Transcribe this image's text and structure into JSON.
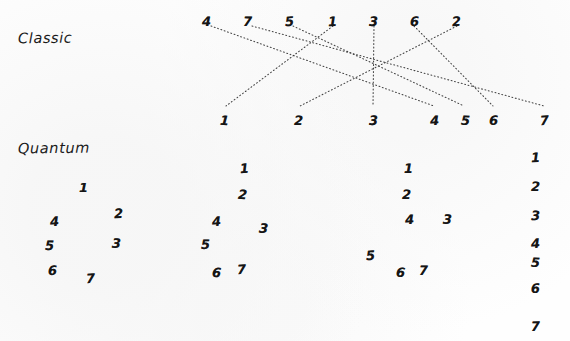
{
  "figure": {
    "background_color": "#fefefe",
    "ink_color": "#151515",
    "line_color": "#3a3a3a",
    "width": 570,
    "height": 341
  },
  "labels": {
    "classic": "Classic",
    "quantum": "Quantum"
  },
  "classic": {
    "input_label": "unsorted permutation",
    "output_label": "sorted sequence",
    "input": [
      {
        "value": "4",
        "x": 202,
        "y": 14
      },
      {
        "value": "7",
        "x": 243,
        "y": 14
      },
      {
        "value": "5",
        "x": 285,
        "y": 14
      },
      {
        "value": "1",
        "x": 328,
        "y": 14
      },
      {
        "value": "3",
        "x": 369,
        "y": 14
      },
      {
        "value": "6",
        "x": 410,
        "y": 14
      },
      {
        "value": "2",
        "x": 452,
        "y": 14
      }
    ],
    "output": [
      {
        "value": "1",
        "x": 220,
        "y": 113
      },
      {
        "value": "2",
        "x": 294,
        "y": 113
      },
      {
        "value": "3",
        "x": 369,
        "y": 113
      },
      {
        "value": "4",
        "x": 430,
        "y": 113
      },
      {
        "value": "5",
        "x": 461,
        "y": 113
      },
      {
        "value": "6",
        "x": 489,
        "y": 113
      },
      {
        "value": "7",
        "x": 540,
        "y": 113
      }
    ],
    "mapping": [
      {
        "from": "4",
        "to": "4",
        "x1": 211,
        "y1": 26,
        "x2": 434,
        "y2": 106
      },
      {
        "from": "7",
        "to": "7",
        "x1": 252,
        "y1": 26,
        "x2": 544,
        "y2": 106
      },
      {
        "from": "5",
        "to": "5",
        "x1": 293,
        "y1": 26,
        "x2": 464,
        "y2": 106
      },
      {
        "from": "1",
        "to": "1",
        "x1": 333,
        "y1": 26,
        "x2": 226,
        "y2": 106
      },
      {
        "from": "3",
        "to": "3",
        "x1": 374,
        "y1": 26,
        "x2": 373,
        "y2": 106
      },
      {
        "from": "6",
        "to": "6",
        "x1": 414,
        "y1": 26,
        "x2": 493,
        "y2": 106
      },
      {
        "from": "2",
        "to": "2",
        "x1": 457,
        "y1": 26,
        "x2": 300,
        "y2": 106
      }
    ]
  },
  "quantum": {
    "description": "superposed states collapsing toward a sorted column",
    "states": [
      {
        "name": "state-1",
        "digits": [
          {
            "value": "1",
            "x": 79,
            "y": 180
          },
          {
            "value": "2",
            "x": 114,
            "y": 206
          },
          {
            "value": "3",
            "x": 112,
            "y": 236
          },
          {
            "value": "4",
            "x": 50,
            "y": 214
          },
          {
            "value": "5",
            "x": 45,
            "y": 238
          },
          {
            "value": "6",
            "x": 48,
            "y": 263
          },
          {
            "value": "7",
            "x": 86,
            "y": 271
          }
        ]
      },
      {
        "name": "state-2",
        "digits": [
          {
            "value": "1",
            "x": 240,
            "y": 161
          },
          {
            "value": "2",
            "x": 238,
            "y": 187
          },
          {
            "value": "3",
            "x": 259,
            "y": 221
          },
          {
            "value": "4",
            "x": 212,
            "y": 214
          },
          {
            "value": "5",
            "x": 201,
            "y": 237
          },
          {
            "value": "6",
            "x": 212,
            "y": 265
          },
          {
            "value": "7",
            "x": 237,
            "y": 262
          }
        ]
      },
      {
        "name": "state-3",
        "digits": [
          {
            "value": "1",
            "x": 404,
            "y": 161
          },
          {
            "value": "2",
            "x": 402,
            "y": 187
          },
          {
            "value": "3",
            "x": 443,
            "y": 212
          },
          {
            "value": "4",
            "x": 405,
            "y": 212
          },
          {
            "value": "5",
            "x": 366,
            "y": 248
          },
          {
            "value": "6",
            "x": 396,
            "y": 265
          },
          {
            "value": "7",
            "x": 419,
            "y": 263
          }
        ]
      },
      {
        "name": "state-collapsed",
        "digits": [
          {
            "value": "1",
            "x": 531,
            "y": 150
          },
          {
            "value": "2",
            "x": 531,
            "y": 179
          },
          {
            "value": "3",
            "x": 531,
            "y": 208
          },
          {
            "value": "4",
            "x": 531,
            "y": 236
          },
          {
            "value": "5",
            "x": 531,
            "y": 255
          },
          {
            "value": "6",
            "x": 531,
            "y": 281
          },
          {
            "value": "7",
            "x": 531,
            "y": 319
          }
        ]
      }
    ]
  }
}
